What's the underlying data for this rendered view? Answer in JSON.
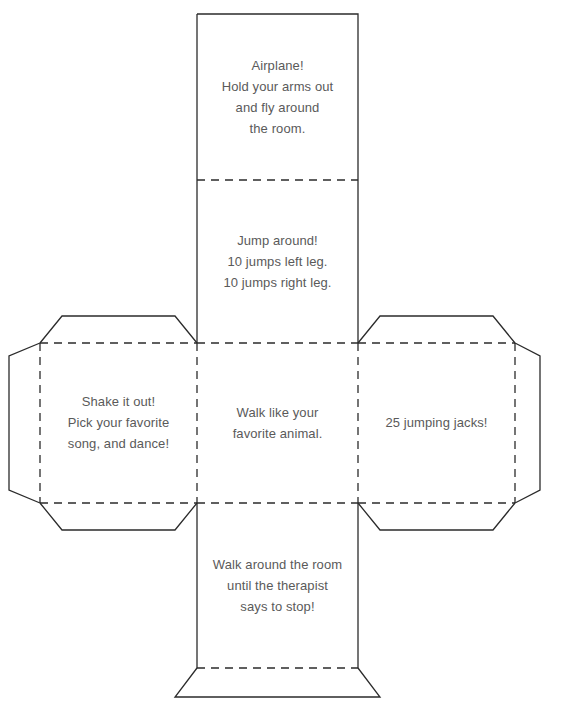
{
  "document": {
    "title": "Exercise Dice Cube Net",
    "type": "printable-paper-cube-template",
    "page_width": 565,
    "page_height": 718,
    "background_color": "#ffffff",
    "line_color": "#2b2b2b",
    "text_color": "#5a5a5a",
    "solid_line_meaning": "cut line",
    "dashed_line_meaning": "fold line"
  },
  "geometry": {
    "grid_columns": [
      197,
      358
    ],
    "grid_rows": [
      14,
      180,
      343,
      503,
      668
    ],
    "left_panel_left": 40,
    "right_panel_right": 515,
    "left_flap_outer": 9,
    "right_flap_outer": 540,
    "bottom_flap_outer": 697,
    "flap_inset": 22
  },
  "panels": [
    {
      "id": "panel-top",
      "position": "top",
      "x": 197,
      "y": 14,
      "width": 161,
      "height": 166,
      "edges": {
        "top": "cut",
        "right": "cut",
        "bottom": "fold",
        "left": "cut"
      },
      "lines": [
        "Airplane!",
        "Hold your arms out",
        "and fly around",
        "the room."
      ]
    },
    {
      "id": "panel-upper-middle",
      "position": "upper-middle",
      "x": 197,
      "y": 180,
      "width": 161,
      "height": 163,
      "edges": {
        "top": "fold",
        "right": "cut",
        "bottom": "fold",
        "left": "cut"
      },
      "lines": [
        "Jump around!",
        "10 jumps left leg.",
        "10 jumps right leg."
      ]
    },
    {
      "id": "panel-left",
      "position": "left",
      "x": 40,
      "y": 343,
      "width": 157,
      "height": 160,
      "edges": {
        "top": "fold",
        "right": "fold",
        "bottom": "fold",
        "left": "fold"
      },
      "lines": [
        "Shake it out!",
        "Pick your favorite",
        "song, and dance!"
      ]
    },
    {
      "id": "panel-center",
      "position": "center",
      "x": 197,
      "y": 343,
      "width": 161,
      "height": 160,
      "edges": {
        "top": "fold",
        "right": "fold",
        "bottom": "fold",
        "left": "fold"
      },
      "lines": [
        "Walk like your",
        "favorite animal."
      ]
    },
    {
      "id": "panel-right",
      "position": "right",
      "x": 358,
      "y": 343,
      "width": 157,
      "height": 160,
      "edges": {
        "top": "fold",
        "right": "fold",
        "bottom": "fold",
        "left": "fold"
      },
      "lines": [
        "25 jumping jacks!"
      ]
    },
    {
      "id": "panel-bottom",
      "position": "bottom",
      "x": 197,
      "y": 503,
      "width": 161,
      "height": 165,
      "edges": {
        "top": "fold",
        "right": "cut",
        "bottom": "fold",
        "left": "cut"
      },
      "lines": [
        "Walk around the room",
        "until the therapist",
        "says to stop!"
      ]
    }
  ],
  "flaps": [
    {
      "id": "flap-left-top",
      "attached_to": "panel-left",
      "side": "top"
    },
    {
      "id": "flap-left-left",
      "attached_to": "panel-left",
      "side": "left"
    },
    {
      "id": "flap-left-bottom",
      "attached_to": "panel-left",
      "side": "bottom"
    },
    {
      "id": "flap-right-top",
      "attached_to": "panel-right",
      "side": "top"
    },
    {
      "id": "flap-right-right",
      "attached_to": "panel-right",
      "side": "right"
    },
    {
      "id": "flap-right-bottom",
      "attached_to": "panel-right",
      "side": "bottom"
    },
    {
      "id": "flap-bottom-bottom",
      "attached_to": "panel-bottom",
      "side": "bottom"
    }
  ],
  "paths": {
    "outline": "M 197 14 L 358 14 L 358 343 L 380 316 L 493 316 L 515 343 L 518 343 L 540 356 L 540 490 L 518 503 L 515 503 L 493 530 L 380 530 L 358 503 L 358 668 L 380 697 L 475 697 L 497 668 L 358 668 L 358 503 L 197 503 L 197 668 L 175 697 L 80 697 L 58 668 L 197 668 L 197 503 L 175 530 L 62 530 L 40 503 L 37 503 L 9 490 L 9 356 L 37 343 L 40 343 L 62 316 L 175 316 L 197 343 Z",
    "outline_segments": [
      "M 197 14 L 358 14 L 358 343",
      "M 358 343 L 380 316 L 493 316 L 515 343",
      "M 515 343 L 540 356 L 540 490 L 515 503",
      "M 515 503 L 493 530 L 380 530 L 358 503",
      "M 358 503 L 358 668",
      "M 358 668 L 380 697 L 175 697 L 197 668",
      "M 197 668 L 197 503",
      "M 197 503 L 175 530 L 62 530 L 40 503",
      "M 40 503 L 9 490 L 9 356 L 40 343",
      "M 40 343 L 62 316 L 175 316 L 197 343",
      "M 197 343 L 197 14"
    ],
    "folds": [
      "M 197 180 L 358 180",
      "M 197 343 L 358 343",
      "M 197 503 L 358 503",
      "M 197 668 L 358 668",
      "M 40 343 L 197 343",
      "M 40 503 L 197 503",
      "M 40 343 L 40 503",
      "M 358 343 L 515 343",
      "M 358 503 L 515 503",
      "M 515 343 L 515 503",
      "M 197 343 L 197 503",
      "M 358 343 L 358 503"
    ]
  }
}
